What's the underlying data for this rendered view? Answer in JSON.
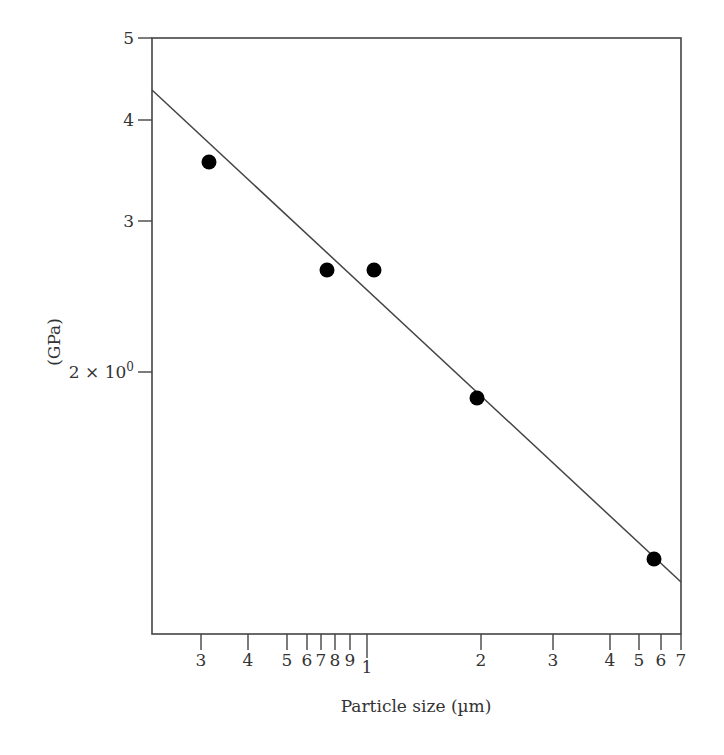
{
  "chart_data": {
    "type": "scatter",
    "title": "",
    "xlabel": "Particle size (µm)",
    "ylabel": "(GPa)",
    "xscale": "log",
    "yscale": "log",
    "xlim": [
      0.25,
      7
    ],
    "ylim": [
      0.98,
      5
    ],
    "grid": false,
    "legend": null,
    "x_ticks": [
      {
        "label": "3",
        "value": 0.3,
        "px": 201
      },
      {
        "label": "4",
        "value": 0.4,
        "px": 248
      },
      {
        "label": "5",
        "value": 0.5,
        "px": 287
      },
      {
        "label": "6",
        "value": 0.6,
        "px": 307
      },
      {
        "label": "7",
        "value": 0.7,
        "px": 321
      },
      {
        "label": "8",
        "value": 0.8,
        "px": 335
      },
      {
        "label": "9",
        "value": 0.9,
        "px": 350
      },
      {
        "label": "1",
        "value": 1,
        "px": 367
      },
      {
        "label": "2",
        "value": 2,
        "px": 481
      },
      {
        "label": "3",
        "value": 3,
        "px": 553
      },
      {
        "label": "4",
        "value": 4,
        "px": 610
      },
      {
        "label": "5",
        "value": 5,
        "px": 639
      },
      {
        "label": "6",
        "value": 6,
        "px": 661
      },
      {
        "label": "7",
        "value": 7,
        "px": 681
      }
    ],
    "y_ticks": [
      {
        "label": "5",
        "value": 5,
        "px": 38
      },
      {
        "label": "4",
        "value": 4,
        "px": 120
      },
      {
        "label": "3",
        "value": 3,
        "px": 221
      },
      {
        "label": "2 × 10",
        "sup": "0",
        "value": 2,
        "px": 372
      }
    ],
    "series": [
      {
        "name": "measured",
        "marker": "filled-circle",
        "color": "#000000",
        "points": [
          {
            "x": 0.315,
            "y": 3.55,
            "px": 209,
            "py": 162
          },
          {
            "x": 0.74,
            "y": 2.64,
            "px": 327,
            "py": 270
          },
          {
            "x": 1.04,
            "y": 2.64,
            "px": 374,
            "py": 270
          },
          {
            "x": 1.95,
            "y": 1.88,
            "px": 477,
            "py": 398
          },
          {
            "x": 5.7,
            "y": 1.21,
            "px": 654,
            "py": 559
          }
        ]
      },
      {
        "name": "fit",
        "type": "line",
        "color": "#444444",
        "points": [
          {
            "x": 0.25,
            "y": 4.35,
            "px": 152,
            "py": 90
          },
          {
            "x": 7,
            "y": 1.15,
            "px": 681,
            "py": 582
          }
        ]
      }
    ],
    "plot_box_px": {
      "left": 152,
      "top": 38,
      "right": 681,
      "bottom": 634
    }
  }
}
